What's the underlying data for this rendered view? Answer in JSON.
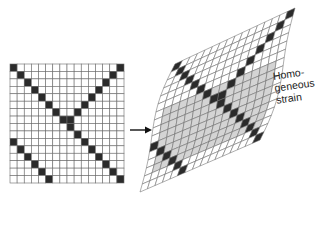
{
  "figure": {
    "grid_size": 16,
    "colors": {
      "background": "#ffffff",
      "line": "#6a6a6a",
      "cell": "#ffffff",
      "dark_cell": "#2b2b2b",
      "shaded_cell": "#d4d4d4"
    },
    "undeformed": {
      "name": "original-grid",
      "x": 10,
      "y": 64,
      "width": 114,
      "height": 119
    },
    "deformed": {
      "name": "deformed-grid",
      "corners": {
        "top_left": [
          175,
          64
        ],
        "top_right": [
          295,
          8
        ],
        "bottom_right": [
          260,
          140
        ],
        "bottom_left": [
          140,
          192
        ]
      },
      "bulge": 10
    },
    "dark_lines": [
      {
        "name": "main-diagonal",
        "cells": [
          [
            0,
            0
          ],
          [
            1,
            1
          ],
          [
            2,
            2
          ],
          [
            3,
            3
          ],
          [
            4,
            4
          ],
          [
            5,
            5
          ],
          [
            6,
            6
          ],
          [
            7,
            7
          ],
          [
            8,
            8
          ],
          [
            9,
            9
          ],
          [
            10,
            10
          ],
          [
            11,
            11
          ],
          [
            12,
            12
          ],
          [
            13,
            13
          ],
          [
            14,
            14
          ],
          [
            15,
            15
          ]
        ]
      },
      {
        "name": "anti-diagonal",
        "cells": [
          [
            0,
            15
          ],
          [
            1,
            14
          ],
          [
            2,
            13
          ],
          [
            3,
            12
          ],
          [
            4,
            11
          ],
          [
            5,
            10
          ],
          [
            6,
            9
          ],
          [
            7,
            8
          ]
        ]
      },
      {
        "name": "lower-diagonal",
        "cells": [
          [
            10,
            0
          ],
          [
            11,
            1
          ],
          [
            12,
            2
          ],
          [
            13,
            3
          ],
          [
            14,
            4
          ],
          [
            15,
            5
          ]
        ]
      }
    ],
    "shaded_region": {
      "row_from": 6,
      "row_to": 13,
      "col_from": 1,
      "col_to": 14
    },
    "arrow": {
      "from": [
        130,
        130
      ],
      "to": [
        152,
        130
      ]
    },
    "label": {
      "lines": [
        "Homo-",
        "geneous",
        "strain"
      ]
    }
  }
}
